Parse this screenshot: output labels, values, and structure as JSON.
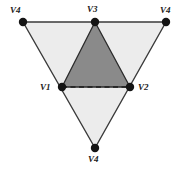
{
  "figure": {
    "name": "nested-triangle-diagram",
    "background_color": "#ffffff",
    "outer_triangle": {
      "fill_color": "#ececec",
      "stroke_color": "#3a3a3a",
      "orientation": "point-down",
      "vertices": [
        {
          "id": "outer-top-left",
          "label": "V4",
          "x": 23,
          "y": 22
        },
        {
          "id": "outer-top-right",
          "label": "V4",
          "x": 166,
          "y": 22
        },
        {
          "id": "outer-bottom",
          "label": "V4",
          "x": 95,
          "y": 148
        }
      ]
    },
    "inner_triangle": {
      "fill_color": "#8a8a8a",
      "stroke_color": "#2b2b2b",
      "orientation": "point-up",
      "dashed_edge": "V1-V2",
      "vertices": [
        {
          "id": "inner-left",
          "label": "V1",
          "x": 62,
          "y": 87
        },
        {
          "id": "inner-right",
          "label": "V2",
          "x": 130,
          "y": 87
        },
        {
          "id": "inner-top",
          "label": "V3",
          "x": 95,
          "y": 22
        }
      ]
    },
    "dot": {
      "radius": 4,
      "fill_color": "#141414"
    },
    "labels": [
      {
        "name": "label-v4-top-left",
        "text": "V4",
        "x": 10,
        "y": 6
      },
      {
        "name": "label-v3-top",
        "text": "V3",
        "x": 87,
        "y": 5
      },
      {
        "name": "label-v4-top-right",
        "text": "V4",
        "x": 160,
        "y": 6
      },
      {
        "name": "label-v1-left",
        "text": "V1",
        "x": 40,
        "y": 83
      },
      {
        "name": "label-v2-right",
        "text": "V2",
        "x": 138,
        "y": 83
      },
      {
        "name": "label-v4-bottom",
        "text": "V4",
        "x": 88,
        "y": 155
      }
    ]
  }
}
